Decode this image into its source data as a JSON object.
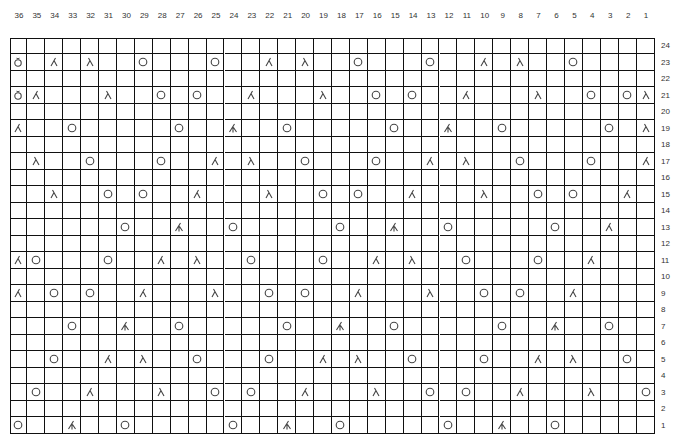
{
  "chart": {
    "columns": 36,
    "rows": 24,
    "column_labels": [
      "36",
      "35",
      "34",
      "33",
      "32",
      "31",
      "30",
      "29",
      "28",
      "27",
      "26",
      "25",
      "24",
      "23",
      "22",
      "21",
      "20",
      "19",
      "18",
      "17",
      "16",
      "15",
      "14",
      "13",
      "12",
      "11",
      "10",
      "9",
      "8",
      "7",
      "6",
      "5",
      "4",
      "3",
      "2",
      "1"
    ],
    "row_labels": [
      "24",
      "23",
      "22",
      "21",
      "20",
      "19",
      "18",
      "17",
      "16",
      "15",
      "14",
      "13",
      "12",
      "11",
      "10",
      "9",
      "8",
      "7",
      "6",
      "5",
      "4",
      "3",
      "2",
      "1"
    ],
    "legend_symbols": {
      "O": "yarn-over",
      "L": "left-leaning-decrease",
      "R": "right-leaning-decrease",
      "D": "double-decrease",
      "B": "yarn-over-bobble"
    },
    "stitches": {
      "23": {
        "36": "B",
        "34": "R",
        "32": "L",
        "29": "O",
        "25": "O",
        "22": "R",
        "20": "L",
        "17": "O",
        "13": "O",
        "10": "R",
        "8": "L",
        "5": "O"
      },
      "21": {
        "36": "B",
        "35": "R",
        "31": "L",
        "28": "O",
        "26": "O",
        "23": "R",
        "19": "L",
        "16": "O",
        "14": "O",
        "11": "R",
        "7": "L",
        "4": "O",
        "2": "O",
        "1": "L"
      },
      "19": {
        "36": "R",
        "33": "O",
        "27": "O",
        "24": "D",
        "21": "O",
        "15": "O",
        "12": "D",
        "9": "O",
        "3": "O",
        "1": "L"
      },
      "17": {
        "35": "L",
        "32": "O",
        "28": "O",
        "25": "R",
        "23": "L",
        "20": "O",
        "16": "O",
        "13": "R",
        "11": "L",
        "8": "O",
        "4": "O",
        "1": "R"
      },
      "15": {
        "34": "L",
        "31": "O",
        "29": "O",
        "26": "R",
        "22": "L",
        "19": "O",
        "17": "O",
        "14": "R",
        "10": "L",
        "7": "O",
        "5": "O",
        "2": "R"
      },
      "13": {
        "30": "O",
        "27": "D",
        "24": "O",
        "18": "O",
        "15": "D",
        "12": "O",
        "6": "O",
        "3": "R"
      },
      "11": {
        "36": "R",
        "35": "O",
        "31": "O",
        "28": "R",
        "26": "L",
        "23": "O",
        "19": "O",
        "16": "R",
        "14": "L",
        "11": "O",
        "7": "O",
        "4": "R"
      },
      "9": {
        "36": "R",
        "34": "O",
        "32": "O",
        "29": "R",
        "25": "L",
        "22": "O",
        "20": "O",
        "17": "R",
        "13": "L",
        "10": "O",
        "8": "O",
        "5": "R"
      },
      "7": {
        "33": "O",
        "30": "D",
        "27": "O",
        "21": "O",
        "18": "D",
        "15": "O",
        "9": "O",
        "6": "D",
        "3": "O"
      },
      "5": {
        "34": "O",
        "31": "R",
        "29": "L",
        "26": "O",
        "22": "O",
        "19": "R",
        "17": "L",
        "14": "O",
        "10": "O",
        "7": "R",
        "5": "L",
        "2": "O"
      },
      "3": {
        "35": "O",
        "32": "R",
        "28": "L",
        "25": "O",
        "23": "O",
        "20": "R",
        "16": "L",
        "13": "O",
        "11": "O",
        "8": "R",
        "4": "L",
        "1": "O"
      },
      "1": {
        "36": "O",
        "33": "D",
        "30": "O",
        "24": "O",
        "21": "D",
        "18": "O",
        "12": "O",
        "9": "D",
        "6": "O"
      }
    },
    "colors": {
      "line": "#111111",
      "symbol": "#444444",
      "background": "#ffffff"
    }
  }
}
